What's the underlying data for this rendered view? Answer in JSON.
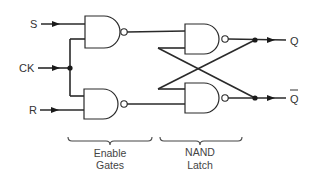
{
  "inputs": {
    "s": "S",
    "ck": "CK",
    "r": "R"
  },
  "outputs": {
    "q": "Q",
    "q_bar": "Q"
  },
  "sections": {
    "enable": {
      "line1": "Enable",
      "line2": "Gates"
    },
    "latch": {
      "line1": "NAND",
      "line2": "Latch"
    }
  },
  "gates": [
    {
      "id": "enable-top",
      "type": "NAND"
    },
    {
      "id": "enable-bottom",
      "type": "NAND"
    },
    {
      "id": "latch-top",
      "type": "NAND"
    },
    {
      "id": "latch-bottom",
      "type": "NAND"
    }
  ],
  "colors": {
    "line": "#2a2a2a",
    "background": "#ffffff"
  }
}
